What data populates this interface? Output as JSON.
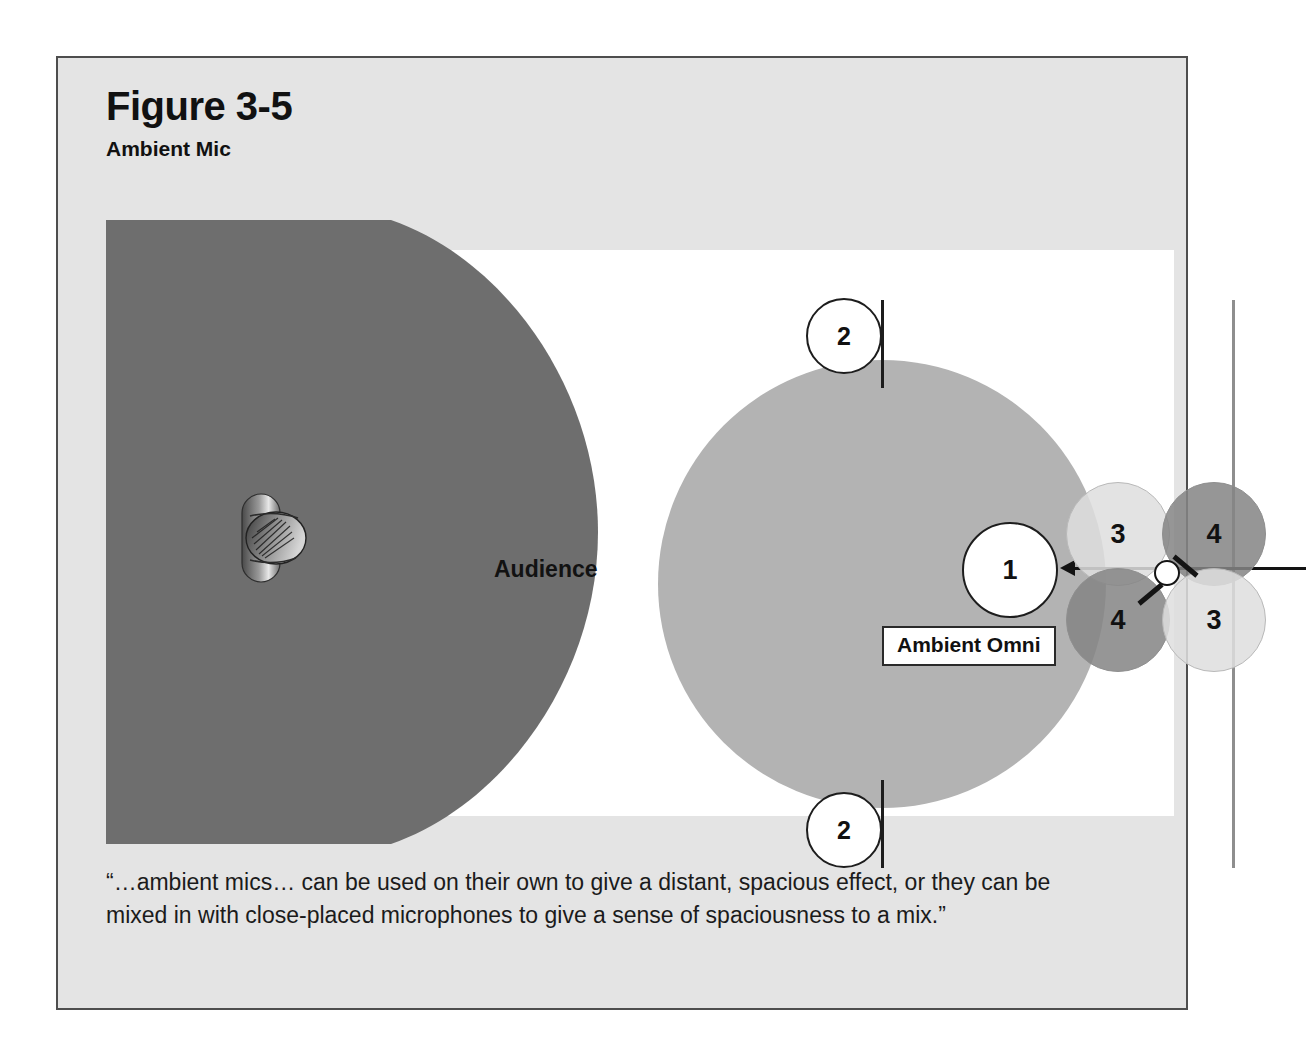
{
  "figure": {
    "title": "Figure 3-5",
    "subtitle": "Ambient Mic",
    "caption": "“…ambient mics… can be used on their own to give a distant, spacious effect, or they can be mixed in with close-placed microphones to give a sense of spaciousness to a mix.”"
  },
  "diagram": {
    "audience_label": "Audience",
    "ambient_omni_label": "Ambient Omni",
    "markers": {
      "source_to_mic": "1",
      "stage_edge_top": "2",
      "stage_edge_bottom": "2",
      "lobe_top_left": "3",
      "lobe_top_right": "4",
      "lobe_bottom_left": "4",
      "lobe_bottom_right": "3"
    },
    "icons": {
      "source": "performer-source-icon",
      "microphone": "ambient-microphone-icon",
      "arrow": "left-arrow-icon"
    }
  },
  "colors": {
    "page_background": "#ffffff",
    "frame_background": "#e4e4e4",
    "frame_border": "#4e4e4e",
    "stage_fill": "#6e6e6e",
    "field_fill": "#ffffff",
    "ambient_circle_fill": "#b3b3b3",
    "lobe_light_fill": "#dedede",
    "lobe_dark_fill": "#858585",
    "ink": "#111111"
  }
}
